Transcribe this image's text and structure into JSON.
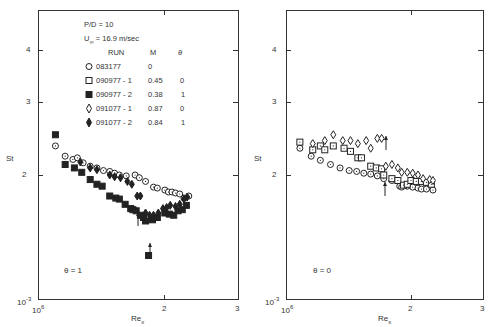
{
  "chart_data": [
    {
      "type": "scatter",
      "title": "",
      "annotation": "θ = 1",
      "xlabel": "Re_x",
      "ylabel": "St",
      "xscale": "log",
      "yscale": "log",
      "xlim": [
        1000000,
        3000000
      ],
      "ylim": [
        0.001,
        0.005
      ],
      "x_ticks": [
        "10^6",
        "2",
        "3"
      ],
      "y_ticks": [
        "10^-3",
        "2",
        "3",
        "4"
      ],
      "legend": {
        "header": [
          "P/D = 10",
          "U∞ = 16.9 m/sec"
        ],
        "columns": [
          "RUN",
          "M",
          "θ"
        ],
        "entries": [
          {
            "marker": "open-circle",
            "run": "083177",
            "M": "0",
            "theta": ""
          },
          {
            "marker": "open-square",
            "run": "090977-1",
            "M": "0.45",
            "theta": "0"
          },
          {
            "marker": "filled-square",
            "run": "090977-2",
            "M": "0.38",
            "theta": "1"
          },
          {
            "marker": "open-diamond",
            "run": "091077-1",
            "M": "0.87",
            "theta": "0"
          },
          {
            "marker": "filled-diamond",
            "run": "091077-2",
            "M": "0.84",
            "theta": "1"
          }
        ]
      },
      "series": [
        {
          "name": "083177",
          "marker": "open-circle",
          "points": [
            [
              1.1,
              2.35
            ],
            [
              1.16,
              2.22
            ],
            [
              1.21,
              2.18
            ],
            [
              1.24,
              2.2
            ],
            [
              1.28,
              2.14
            ],
            [
              1.33,
              2.1
            ],
            [
              1.38,
              2.08
            ],
            [
              1.43,
              2.05
            ],
            [
              1.48,
              2.04
            ],
            [
              1.52,
              2.02
            ],
            [
              1.56,
              2.0
            ],
            [
              1.62,
              1.99
            ],
            [
              1.7,
              2.0
            ],
            [
              1.74,
              1.97
            ],
            [
              1.8,
              1.93
            ],
            [
              1.88,
              1.87
            ],
            [
              1.92,
              1.86
            ],
            [
              2.0,
              1.84
            ],
            [
              2.04,
              1.82
            ],
            [
              2.08,
              1.82
            ],
            [
              2.12,
              1.81
            ],
            [
              2.17,
              1.8
            ],
            [
              2.22,
              1.76
            ],
            [
              2.28,
              1.78
            ]
          ]
        },
        {
          "name": "090977-2",
          "marker": "filled-square",
          "points": [
            [
              1.1,
              2.5
            ],
            [
              1.16,
              2.12
            ],
            [
              1.22,
              2.08
            ],
            [
              1.27,
              2.03
            ],
            [
              1.33,
              1.95
            ],
            [
              1.38,
              1.9
            ],
            [
              1.42,
              1.88
            ],
            [
              1.48,
              1.78
            ],
            [
              1.53,
              1.76
            ],
            [
              1.56,
              1.75
            ],
            [
              1.61,
              1.7
            ],
            [
              1.66,
              1.66
            ],
            [
              1.68,
              1.65
            ],
            [
              1.71,
              1.64
            ],
            [
              1.75,
              1.6
            ],
            [
              1.78,
              1.58
            ],
            [
              1.8,
              1.55
            ],
            [
              1.83,
              1.28
            ],
            [
              1.87,
              1.56
            ],
            [
              1.92,
              1.58
            ],
            [
              2.0,
              1.62
            ],
            [
              2.05,
              1.61
            ],
            [
              2.1,
              1.6
            ],
            [
              2.15,
              1.64
            ],
            [
              2.2,
              1.65
            ],
            [
              2.25,
              1.69
            ]
          ]
        },
        {
          "name": "091077-2",
          "marker": "filled-diamond",
          "points": [
            [
              1.26,
              2.15
            ],
            [
              1.33,
              2.08
            ],
            [
              1.38,
              2.06
            ],
            [
              1.48,
              2.0
            ],
            [
              1.52,
              1.98
            ],
            [
              1.57,
              1.97
            ],
            [
              1.63,
              1.93
            ],
            [
              1.67,
              1.9
            ],
            [
              1.72,
              1.78
            ],
            [
              1.75,
              1.78
            ],
            [
              1.8,
              1.62
            ],
            [
              1.84,
              1.6
            ],
            [
              1.88,
              1.6
            ],
            [
              1.93,
              1.62
            ],
            [
              1.98,
              1.66
            ],
            [
              2.02,
              1.67
            ],
            [
              2.06,
              1.69
            ],
            [
              2.12,
              1.68
            ],
            [
              2.17,
              1.7
            ],
            [
              2.22,
              1.75
            ],
            [
              2.26,
              1.77
            ]
          ]
        }
      ]
    },
    {
      "type": "scatter",
      "title": "",
      "annotation": "θ = 0",
      "xlabel": "Re_x",
      "ylabel": "St",
      "xscale": "log",
      "yscale": "log",
      "xlim": [
        1000000,
        3000000
      ],
      "ylim": [
        0.001,
        0.005
      ],
      "x_ticks": [
        "10^6",
        "2",
        "3"
      ],
      "y_ticks": [
        "10^-3",
        "2",
        "3",
        "4"
      ],
      "series": [
        {
          "name": "083177",
          "marker": "open-circle",
          "points": [
            [
              1.08,
              2.32
            ],
            [
              1.15,
              2.22
            ],
            [
              1.21,
              2.17
            ],
            [
              1.28,
              2.12
            ],
            [
              1.35,
              2.08
            ],
            [
              1.42,
              2.05
            ],
            [
              1.48,
              2.04
            ],
            [
              1.54,
              2.02
            ],
            [
              1.6,
              2.01
            ],
            [
              1.66,
              1.99
            ],
            [
              1.72,
              1.96
            ],
            [
              1.8,
              1.94
            ],
            [
              1.88,
              1.88
            ],
            [
              1.9,
              1.87
            ],
            [
              1.96,
              1.88
            ],
            [
              2.02,
              1.87
            ],
            [
              2.08,
              1.86
            ],
            [
              2.12,
              1.85
            ],
            [
              2.18,
              1.85
            ],
            [
              2.26,
              1.84
            ]
          ]
        },
        {
          "name": "090977-1",
          "marker": "open-square",
          "points": [
            [
              1.08,
              2.4
            ],
            [
              1.16,
              2.3
            ],
            [
              1.21,
              2.35
            ],
            [
              1.24,
              2.3
            ],
            [
              1.3,
              2.35
            ],
            [
              1.38,
              2.32
            ],
            [
              1.43,
              2.28
            ],
            [
              1.49,
              2.2
            ],
            [
              1.52,
              2.2
            ],
            [
              1.6,
              2.1
            ],
            [
              1.65,
              2.08
            ],
            [
              1.7,
              2.07
            ],
            [
              1.72,
              2.0
            ],
            [
              1.8,
              1.96
            ],
            [
              1.86,
              1.94
            ],
            [
              1.92,
              1.89
            ],
            [
              1.96,
              1.9
            ],
            [
              2.0,
              1.94
            ],
            [
              2.06,
              1.93
            ],
            [
              2.12,
              1.93
            ],
            [
              2.18,
              1.92
            ],
            [
              2.24,
              1.9
            ]
          ]
        },
        {
          "name": "091077-1",
          "marker": "open-diamond",
          "points": [
            [
              1.16,
              2.38
            ],
            [
              1.24,
              2.42
            ],
            [
              1.3,
              2.5
            ],
            [
              1.37,
              2.42
            ],
            [
              1.43,
              2.42
            ],
            [
              1.49,
              2.38
            ],
            [
              1.56,
              2.42
            ],
            [
              1.6,
              2.32
            ],
            [
              1.66,
              2.45
            ],
            [
              1.7,
              2.45
            ],
            [
              1.74,
              2.1
            ],
            [
              1.8,
              2.12
            ],
            [
              1.86,
              2.08
            ],
            [
              1.9,
              2.03
            ],
            [
              1.96,
              2.03
            ],
            [
              2.02,
              2.02
            ],
            [
              2.08,
              2.0
            ],
            [
              2.14,
              1.96
            ],
            [
              2.22,
              1.95
            ],
            [
              2.26,
              1.94
            ]
          ]
        }
      ]
    }
  ],
  "left": {
    "legend": {
      "pd": "P/D = 10",
      "u": "U",
      "usub": "∞",
      "uval": "= 16.9 m/sec",
      "col_run": "RUN",
      "col_m": "M",
      "col_theta": "θ",
      "rows": [
        {
          "run": "083177",
          "m": "0",
          "theta": ""
        },
        {
          "run": "090977 - 1",
          "m": "0.45",
          "theta": "0"
        },
        {
          "run": "090977 - 2",
          "m": "0.38",
          "theta": "1"
        },
        {
          "run": "091077 - 1",
          "m": "0.87",
          "theta": "0"
        },
        {
          "run": "091077 - 2",
          "m": "0.84",
          "theta": "1"
        }
      ]
    },
    "annotation": "θ = 1"
  },
  "right": {
    "annotation": "θ = 0"
  },
  "axes": {
    "ylabel": "St",
    "xlabel": "Re",
    "xlabel_sub": "x",
    "y4": "4",
    "y3": "3",
    "y2": "2",
    "ymin": "10",
    "ymin_exp": "-3",
    "x0": "10",
    "x0_exp": "6",
    "x2": "2",
    "x3": "3"
  }
}
